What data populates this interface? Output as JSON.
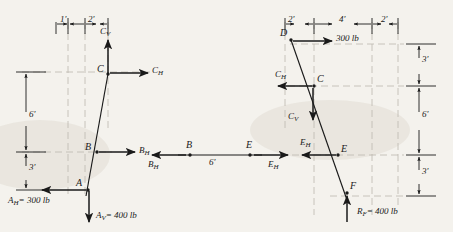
{
  "figure": {
    "type": "free-body-diagram",
    "paper_color": "#f4f2ed",
    "ink_color": "#1a1a1a",
    "construction_line_color": "#b9b4aa"
  },
  "left_member": {
    "name": "member-ABC",
    "points": [
      {
        "label": "C",
        "name": "point-c"
      },
      {
        "label": "B",
        "name": "point-b"
      },
      {
        "label": "A",
        "name": "point-a"
      }
    ],
    "forces": [
      {
        "label": "C",
        "sub": "V",
        "name": "force-cv",
        "direction": "up"
      },
      {
        "label": "C",
        "sub": "H",
        "name": "force-ch",
        "direction": "right"
      },
      {
        "label": "B",
        "sub": "H",
        "name": "force-bh",
        "direction": "right"
      },
      {
        "label": "A",
        "sub": "H",
        "value": "= 300 lb",
        "name": "force-ah",
        "direction": "left"
      },
      {
        "label": "A",
        "sub": "V",
        "value": "= 400 lb",
        "name": "force-av",
        "direction": "down"
      }
    ],
    "dimensions": {
      "top": [
        {
          "value": "1'",
          "name": "dim-1ft"
        },
        {
          "value": "2'",
          "name": "dim-2ft"
        }
      ],
      "left": [
        {
          "value": "6'",
          "name": "dim-6ft"
        },
        {
          "value": "3'",
          "name": "dim-3ft"
        }
      ]
    }
  },
  "middle_member": {
    "name": "member-BE",
    "points": [
      {
        "label": "B",
        "name": "point-b-mid"
      },
      {
        "label": "E",
        "name": "point-e-mid"
      }
    ],
    "forces": [
      {
        "label": "B",
        "sub": "H",
        "name": "force-bh-mid",
        "direction": "left"
      },
      {
        "label": "E",
        "sub": "H",
        "name": "force-eh-mid",
        "direction": "right"
      }
    ],
    "dimensions": {
      "span": {
        "value": "6'",
        "name": "dim-span-6ft"
      }
    }
  },
  "right_member": {
    "name": "member-DCEF",
    "points": [
      {
        "label": "D",
        "name": "point-d"
      },
      {
        "label": "C",
        "name": "point-c-right"
      },
      {
        "label": "E",
        "name": "point-e-right"
      },
      {
        "label": "F",
        "name": "point-f"
      }
    ],
    "forces": [
      {
        "label": "300 lb",
        "name": "force-300lb",
        "direction": "right"
      },
      {
        "label": "C",
        "sub": "H",
        "name": "force-ch-right",
        "direction": "left"
      },
      {
        "label": "C",
        "sub": "V",
        "name": "force-cv-right",
        "direction": "down"
      },
      {
        "label": "E",
        "sub": "H",
        "name": "force-eh-right",
        "direction": "left"
      },
      {
        "label": "R",
        "sub": "F",
        "value": "= 400 lb",
        "name": "force-rf",
        "direction": "up"
      }
    ],
    "dimensions": {
      "top": [
        {
          "value": "2'",
          "name": "dim-2ft-a"
        },
        {
          "value": "4'",
          "name": "dim-4ft"
        },
        {
          "value": "2'",
          "name": "dim-2ft-b"
        }
      ],
      "right": [
        {
          "value": "3'",
          "name": "dim-3ft-top"
        },
        {
          "value": "6'",
          "name": "dim-6ft-right"
        },
        {
          "value": "3'",
          "name": "dim-3ft-bottom"
        }
      ]
    }
  }
}
